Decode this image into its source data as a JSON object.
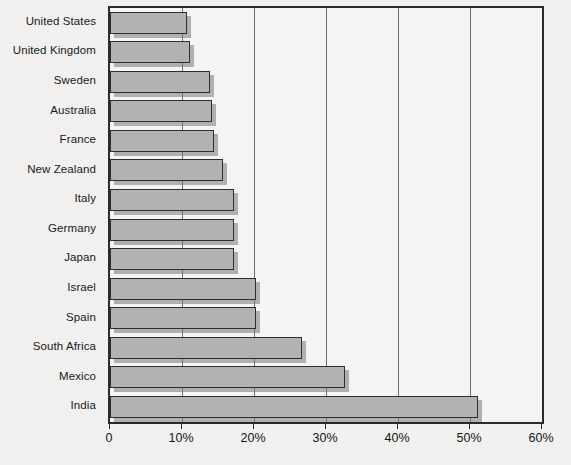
{
  "chart_data": {
    "type": "bar",
    "orientation": "horizontal",
    "title": "",
    "subtitle": "",
    "xlabel": "",
    "ylabel": "",
    "xlim": [
      0,
      60
    ],
    "grid": true,
    "legend": null,
    "x_tick_labels": [
      "0",
      "10%",
      "20%",
      "30%",
      "40%",
      "50%",
      "60%"
    ],
    "x_ticks": [
      0,
      10,
      20,
      30,
      40,
      50,
      60
    ],
    "categories": [
      "United States",
      "United Kingdom",
      "Sweden",
      "Australia",
      "France",
      "New Zealand",
      "Italy",
      "Germany",
      "Japan",
      "Israel",
      "Spain",
      "South Africa",
      "Mexico",
      "India"
    ],
    "values": [
      10.7,
      11.1,
      13.9,
      14.2,
      14.4,
      15.7,
      17.2,
      17.2,
      17.2,
      20.3,
      20.3,
      26.7,
      32.6,
      51.1
    ],
    "value_unit": "%",
    "colors": {
      "bar_fill": "#b2b2b2",
      "bar_border": "#2e2e2e",
      "bar_shadow": "#787878",
      "plot_background": "#f5f4f2",
      "figure_background": "#f1f0ee",
      "axis_line": "#2b2b2b",
      "gridline": "#6d6f71",
      "text": "#16191c"
    }
  }
}
